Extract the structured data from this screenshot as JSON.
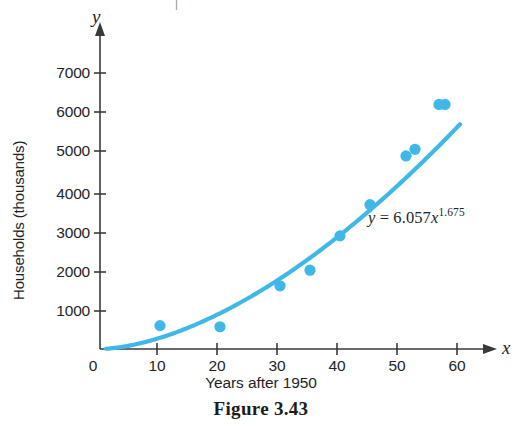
{
  "figure": {
    "caption": "Figure 3.43",
    "top_fragment": "|"
  },
  "axis_names": {
    "y": "y",
    "x": "x"
  },
  "equation": {
    "lhs": "y",
    "equals": "=",
    "coefficient": "6.057",
    "variable": "x",
    "exponent": "1.675",
    "full_text": "y = 6.057x^1.675"
  },
  "colors": {
    "data_blue": "#3FB8E8",
    "axis_gray": "#3A3A3A",
    "text_black": "#221F1F"
  },
  "chart_data": {
    "type": "scatter",
    "title": "Figure 3.43",
    "xlabel": "Years after 1950",
    "ylabel": "Households (thousands)",
    "xlim": [
      0,
      62
    ],
    "ylim": [
      0,
      7600
    ],
    "grid": false,
    "legend": null,
    "xticks": [
      0,
      10,
      20,
      30,
      40,
      50,
      60
    ],
    "xtick_labels": [
      "0",
      "10",
      "20",
      "30",
      "40",
      "50",
      "60"
    ],
    "yticks": [
      1000,
      2000,
      3000,
      4000,
      5000,
      6000,
      7000
    ],
    "ytick_labels": [
      "1000",
      "2000",
      "3000",
      "4000",
      "5000",
      "6000",
      "7000"
    ],
    "x": [
      10,
      20,
      30,
      35,
      40,
      45,
      51,
      52.5,
      56.5,
      57.5
    ],
    "y": [
      600,
      570,
      1620,
      2020,
      2900,
      3700,
      4950,
      5120,
      6270,
      6270
    ],
    "points": [
      {
        "x": 10,
        "y": 600
      },
      {
        "x": 20,
        "y": 570
      },
      {
        "x": 30,
        "y": 1620
      },
      {
        "x": 35,
        "y": 2020
      },
      {
        "x": 40,
        "y": 2900
      },
      {
        "x": 45,
        "y": 3700
      },
      {
        "x": 51,
        "y": 4950
      },
      {
        "x": 52.5,
        "y": 5120
      },
      {
        "x": 56.5,
        "y": 6270
      },
      {
        "x": 57.5,
        "y": 6270
      }
    ],
    "series": [
      {
        "name": "Households data",
        "type": "scatter",
        "values": [
          600,
          570,
          1620,
          2020,
          2900,
          3700,
          4950,
          5120,
          6270,
          6270
        ]
      },
      {
        "name": "Power regression model",
        "type": "line",
        "equation": "y = 6.057x^1.675",
        "model": "power",
        "coefficient": 6.057,
        "exponent": 1.675,
        "x_range": [
          1,
          60
        ]
      }
    ],
    "annotations": [
      {
        "text": "y = 6.057x^1.675",
        "x": 43,
        "y": 3050
      }
    ]
  }
}
